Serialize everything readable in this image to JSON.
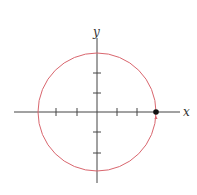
{
  "diagram": {
    "type": "unit-circle-parametric",
    "axes": {
      "x_label": "x",
      "y_label": "y",
      "x_ticks": [
        -3,
        -2,
        -1,
        1,
        2
      ],
      "y_ticks": [
        2,
        1,
        -1,
        -2
      ]
    },
    "circle": {
      "center": [
        0,
        0
      ],
      "radius": 3,
      "color": "#d9666e"
    },
    "marked_point": {
      "coords": [
        3,
        0
      ],
      "color": "#111111"
    },
    "direction_arrow": "counterclockwise"
  }
}
